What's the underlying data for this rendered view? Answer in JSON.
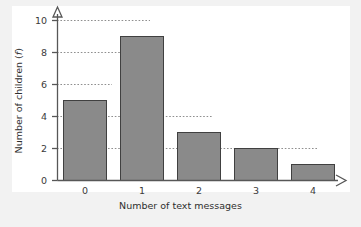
{
  "chart_data": {
    "type": "bar",
    "title": "",
    "subtitle": "",
    "xlabel": "Number of text messages",
    "ylabel": "Number of children (f)",
    "ylabel_plain": "Number of children",
    "ylabel_symbol": "f",
    "categories": [
      "0",
      "1",
      "2",
      "3",
      "4"
    ],
    "values": [
      5,
      9,
      3,
      2,
      1
    ],
    "series": [
      {
        "name": "Number of children",
        "values": [
          5,
          9,
          3,
          2,
          1
        ]
      }
    ],
    "xlim": [
      -0.6,
      5.1
    ],
    "ylim": [
      0,
      10
    ],
    "y_ticks": [
      0,
      2,
      4,
      6,
      8,
      10
    ],
    "x_ticks": [
      "0",
      "1",
      "2",
      "3",
      "4"
    ],
    "grid": true,
    "grid_style": "dotted-horizontal",
    "legend": false,
    "legend_position": "none",
    "bar_color": "#8a8a8a",
    "bar_edge_color": "#404040",
    "axis_color": "#555555",
    "grid_color": "#999999",
    "plot_background": "#ffffff",
    "page_background": "#f2f2f2",
    "axis_arrows": [
      "x-right",
      "y-up"
    ],
    "annotations": []
  },
  "axes": {
    "y_tick_labels": [
      "0",
      "2",
      "4",
      "6",
      "8",
      "10"
    ],
    "x_tick_labels": [
      "0",
      "1",
      "2",
      "3",
      "4"
    ]
  }
}
